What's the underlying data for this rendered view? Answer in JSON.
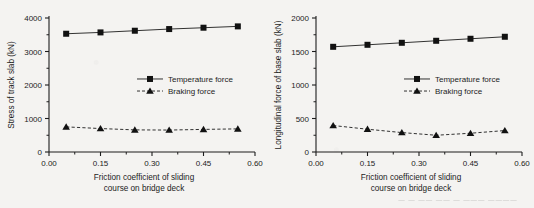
{
  "figure": {
    "panels": [
      {
        "id": "left-panel",
        "ylabel": "Stress of track slab (kN)",
        "xlabel_line1": "Friction coefficient of sliding",
        "xlabel_line2": "course on bridge deck",
        "legend": [
          {
            "label": "Temperature force",
            "marker": "square",
            "line": "solid"
          },
          {
            "label": "Braking force",
            "marker": "triangle",
            "line": "dashed"
          }
        ],
        "yticks": [
          "0",
          "1000",
          "2000",
          "3000",
          "4000"
        ],
        "xticks": [
          "0.00",
          "0.15",
          "0.30",
          "0.45",
          "0.60"
        ]
      },
      {
        "id": "right-panel",
        "ylabel": "Longitudinal force of base slab (kN)",
        "xlabel_line1": "Friction coefficient of sliding",
        "xlabel_line2": "course on bridge deck",
        "legend": [
          {
            "label": "Temperature force",
            "marker": "square",
            "line": "solid"
          },
          {
            "label": "Braking force",
            "marker": "triangle",
            "line": "dashed"
          }
        ],
        "yticks": [
          "0",
          "500",
          "1000",
          "1500",
          "2000"
        ],
        "xticks": [
          "0.00",
          "0.15",
          "0.30",
          "0.45",
          "0.60"
        ]
      }
    ],
    "artifact_text": "— — —— —— — ——— ————"
  },
  "chart_data": [
    {
      "type": "line",
      "title": "",
      "xlabel": "Friction coefficient of sliding course on bridge deck",
      "ylabel": "Stress of track slab (kN)",
      "xlim": [
        0.0,
        0.6
      ],
      "ylim": [
        0,
        4000
      ],
      "xticks": [
        0.0,
        0.15,
        0.3,
        0.45,
        0.6
      ],
      "yticks": [
        0,
        1000,
        2000,
        3000,
        4000
      ],
      "grid": false,
      "legend_position": "center",
      "x": [
        0.05,
        0.15,
        0.25,
        0.35,
        0.45,
        0.55
      ],
      "series": [
        {
          "name": "Temperature force",
          "marker": "square",
          "linestyle": "solid",
          "values": [
            3530,
            3570,
            3620,
            3670,
            3710,
            3750
          ]
        },
        {
          "name": "Braking force",
          "marker": "triangle",
          "linestyle": "dashed",
          "values": [
            750,
            700,
            660,
            655,
            675,
            690
          ]
        }
      ]
    },
    {
      "type": "line",
      "title": "",
      "xlabel": "Friction coefficient of sliding course on bridge deck",
      "ylabel": "Longitudinal force of base slab (kN)",
      "xlim": [
        0.0,
        0.6
      ],
      "ylim": [
        0,
        2000
      ],
      "xticks": [
        0.0,
        0.15,
        0.3,
        0.45,
        0.6
      ],
      "yticks": [
        0,
        500,
        1000,
        1500,
        2000
      ],
      "grid": false,
      "legend_position": "center",
      "x": [
        0.05,
        0.15,
        0.25,
        0.35,
        0.45,
        0.55
      ],
      "series": [
        {
          "name": "Temperature force",
          "marker": "square",
          "linestyle": "solid",
          "values": [
            1570,
            1600,
            1630,
            1660,
            1690,
            1720
          ]
        },
        {
          "name": "Braking force",
          "marker": "triangle",
          "linestyle": "dashed",
          "values": [
            395,
            340,
            290,
            250,
            280,
            320
          ]
        }
      ]
    }
  ]
}
